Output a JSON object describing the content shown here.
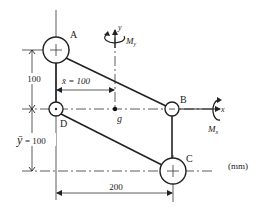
{
  "diagram": {
    "units_label": "(mm)",
    "nodes": [
      {
        "id": "A",
        "label": "A",
        "cx": 56,
        "cy": 50,
        "r": 13
      },
      {
        "id": "B",
        "label": "B",
        "cx": 172,
        "cy": 109,
        "r": 7
      },
      {
        "id": "C",
        "label": "C",
        "cx": 173,
        "cy": 171,
        "r": 13
      },
      {
        "id": "D",
        "label": "D",
        "cx": 56,
        "cy": 109,
        "r": 7
      }
    ],
    "members": [
      {
        "from": "A",
        "to": "D"
      },
      {
        "from": "A",
        "to": "B"
      },
      {
        "from": "B",
        "to": "C"
      },
      {
        "from": "D",
        "to": "C"
      }
    ],
    "centroid": {
      "label": "g"
    },
    "dimensions": {
      "AD_vertical": "100",
      "ybar": "= 100",
      "ybar_symbol": "ȳ",
      "xbar": "x̄ = 100",
      "DC_horizontal": "200"
    },
    "axes": {
      "x_label": "x",
      "y_label": "y",
      "moment_x_label": "M",
      "moment_x_sub": "x",
      "moment_y_label": "M",
      "moment_y_sub": "y"
    }
  }
}
